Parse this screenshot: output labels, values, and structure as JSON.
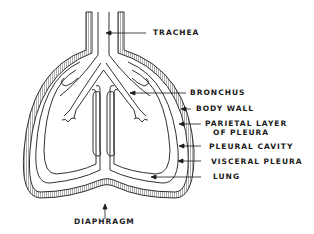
{
  "diagram": {
    "labels": {
      "trachea": "TRACHEA",
      "bronchus": "BRONCHUS",
      "body_wall": "BODY WALL",
      "parietal_line1": "PARIETAL LAYER",
      "parietal_line2": "OF PLEURA",
      "pleural_cavity": "PLEURAL CAVITY",
      "visceral_pleura": "VISCERAL PLEURA",
      "lung": "LUNG",
      "diaphragm": "DIAPHRAGM"
    },
    "colors": {
      "line": "#1a1a1a",
      "background": "#ffffff"
    }
  }
}
